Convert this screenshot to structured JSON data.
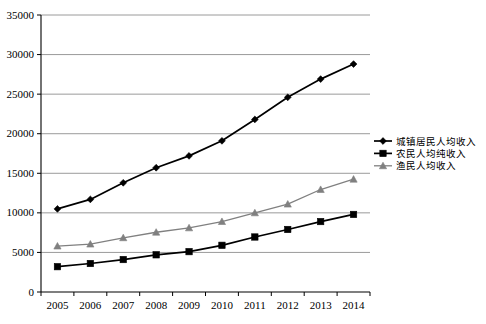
{
  "chart_data": {
    "type": "line",
    "title": "",
    "subtitle": "",
    "xlabel": "",
    "ylabel": "",
    "categories": [
      "2005",
      "2006",
      "2007",
      "2008",
      "2009",
      "2010",
      "2011",
      "2012",
      "2013",
      "2014"
    ],
    "x": [
      2005,
      2006,
      2007,
      2008,
      2009,
      2010,
      2011,
      2012,
      2013,
      2014
    ],
    "ylim": [
      0,
      35000
    ],
    "yticks": [
      0,
      5000,
      10000,
      15000,
      20000,
      25000,
      30000,
      35000
    ],
    "ytick_labels": [
      "0",
      "5000",
      "10000",
      "15000",
      "20000",
      "25000",
      "30000",
      "35000"
    ],
    "grid": "horizontal",
    "legend_position": "right",
    "series": [
      {
        "name": "城镇居民人均收入",
        "marker": "diamond",
        "color": "#000000",
        "values": [
          10500,
          11700,
          13800,
          15700,
          17200,
          19100,
          21800,
          24600,
          26900,
          28800
        ]
      },
      {
        "name": "农民人均纯收入",
        "marker": "square",
        "color": "#000000",
        "values": [
          3200,
          3600,
          4100,
          4700,
          5100,
          5900,
          6950,
          7900,
          8900,
          9800
        ]
      },
      {
        "name": "渔民人均收入",
        "marker": "triangle",
        "color": "#808080",
        "values": [
          5800,
          6050,
          6850,
          7550,
          8100,
          8900,
          10000,
          11100,
          12950,
          14250
        ]
      }
    ]
  },
  "legend": {
    "items": [
      {
        "label": "城镇居民人均收入",
        "marker": "diamond",
        "color": "#000000"
      },
      {
        "label": "农民人均纯收入",
        "marker": "square",
        "color": "#000000"
      },
      {
        "label": "渔民人均收入",
        "marker": "triangle",
        "color": "#808080"
      }
    ]
  },
  "axes": {
    "y": {
      "labels": [
        "35000",
        "30000",
        "25000",
        "20000",
        "15000",
        "10000",
        "5000",
        "0"
      ]
    },
    "x": {
      "labels": [
        "2005",
        "2006",
        "2007",
        "2008",
        "2009",
        "2010",
        "2011",
        "2012",
        "2013",
        "2014"
      ]
    }
  },
  "colors": {
    "axis": "#000000",
    "grid": "#808080",
    "series_primary": "#000000",
    "series_tertiary": "#808080",
    "background": "#ffffff"
  }
}
